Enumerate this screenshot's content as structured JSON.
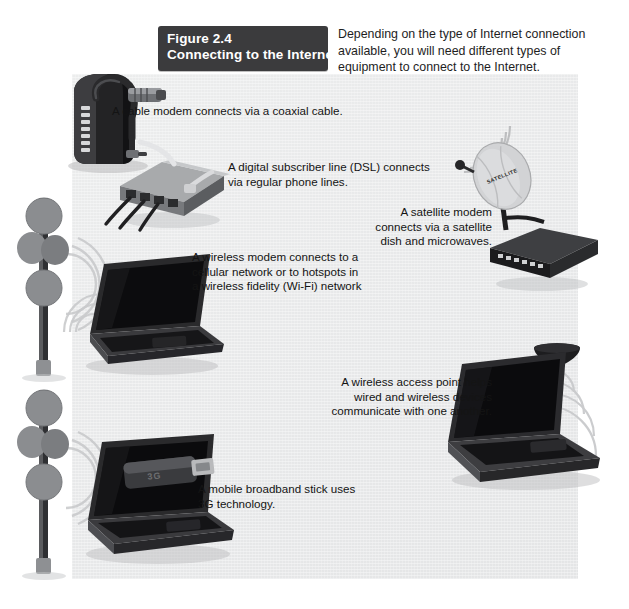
{
  "figure": {
    "number_label": "Figure 2.4",
    "title": "Connecting to the Internet",
    "intro": "Depending on the type of Internet connection available, you will need different types of equipment to connect to the Internet."
  },
  "captions": {
    "cable_modem": "A cable modem connects via a coaxial cable.",
    "dsl_modem": "A digital subscriber line (DSL) connects via regular phone lines.",
    "wireless_modem": "A wireless modem connects to a cellular network or to hotspots in a wireless fidelity (Wi-Fi) network",
    "satellite_modem": "A satellite modem connects via a satellite dish and microwaves.",
    "access_point": "A wireless access point helps wired and wireless devices communicate with one another.",
    "broadband_stick": "A mobile broadband stick uses 3G technology."
  },
  "device_labels": {
    "satellite_dish": "SATELLITE",
    "usb_stick": "3G"
  },
  "colors": {
    "title_block_bg": "#3b3b3d",
    "title_text": "#ffffff",
    "panel_bg": "#e8e9ea",
    "page_bg": "#ffffff",
    "body_text": "#1a1a1a",
    "device_dark": "#1c1c1e",
    "device_gray": "#8a8c8e"
  }
}
